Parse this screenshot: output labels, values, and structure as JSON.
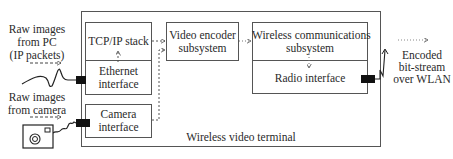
{
  "terminal": {
    "label": "Wireless video terminal"
  },
  "inputs": {
    "pc": {
      "lines": [
        "Raw images",
        "from PC",
        "(IP packets)"
      ]
    },
    "camera": {
      "lines": [
        "Raw images",
        "from camera"
      ]
    }
  },
  "blocks": {
    "tcp_ip": {
      "label": "TCP/IP stack"
    },
    "ethernet": {
      "lines": [
        "Ethernet",
        "interface"
      ]
    },
    "camera_if": {
      "lines": [
        "Camera",
        "interface"
      ]
    },
    "video_encoder": {
      "lines": [
        "Video encoder",
        "subsystem"
      ]
    },
    "wireless_comm": {
      "lines": [
        "Wireless communications",
        "subsystem"
      ]
    },
    "radio": {
      "label": "Radio interface"
    }
  },
  "output": {
    "lines": [
      "Encoded",
      "bit-stream",
      "over WLAN"
    ]
  },
  "icons": {
    "camera": "camera-icon",
    "antenna": "antenna-icon",
    "cable": "cable-icon"
  },
  "colors": {
    "stroke": "#555555",
    "port": "#111111",
    "text": "#2a2a2a"
  }
}
